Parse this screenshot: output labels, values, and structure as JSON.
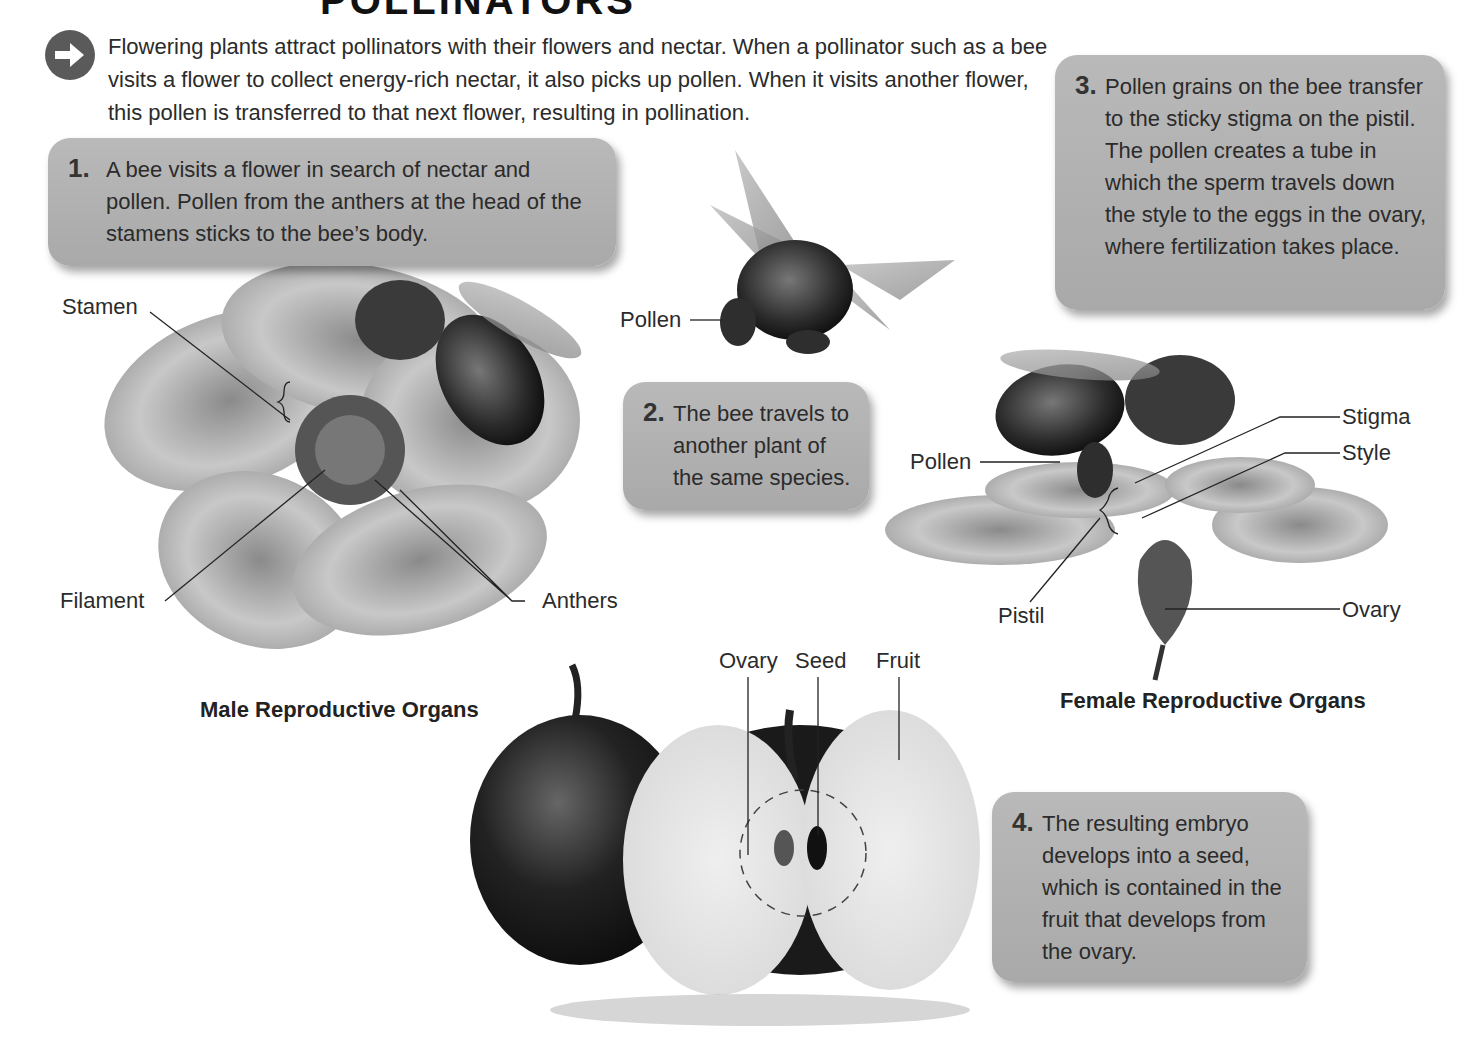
{
  "title": "POLLINATORS",
  "intro": {
    "icon": "arrow-right-circle-icon",
    "text": "Flowering plants attract pollinators with their flowers and nectar. When a pollinator such as a bee visits a flower to collect energy-rich nectar, it also picks up pollen. When it visits another flower, this pollen is transferred to that next flower, resulting in pollination."
  },
  "steps": [
    {
      "num": "1.",
      "text": "A bee visits a flower in search of nectar and pollen. Pollen from the anthers at the head of the stamens sticks to the bee’s body."
    },
    {
      "num": "2.",
      "text": "The bee travels to another plant of the same species."
    },
    {
      "num": "3.",
      "text": "Pollen grains on the bee transfer to the sticky stigma on the pistil. The pollen creates a tube in which the sperm travels down the style to the eggs in the ovary, where fertilization takes place."
    },
    {
      "num": "4.",
      "text": "The resulting embryo develops into a seed, which is contained in the fruit that develops from the ovary."
    }
  ],
  "male_flower": {
    "caption": "Male Reproductive Organs",
    "labels": {
      "stamen": "Stamen",
      "filament": "Filament",
      "anthers": "Anthers"
    }
  },
  "flying_bee": {
    "labels": {
      "pollen": "Pollen"
    }
  },
  "female_flower": {
    "caption": "Female Reproductive Organs",
    "labels": {
      "pollen": "Pollen",
      "stigma": "Stigma",
      "style": "Style",
      "pistil": "Pistil",
      "ovary": "Ovary"
    }
  },
  "apple": {
    "labels": {
      "ovary": "Ovary",
      "seed": "Seed",
      "fruit": "Fruit"
    }
  },
  "colors": {
    "box_fill": "#b0b0b0",
    "text": "#2b2b2b",
    "icon": "#5a5a5a"
  }
}
